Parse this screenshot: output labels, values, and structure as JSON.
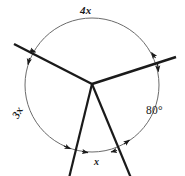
{
  "figure": {
    "type": "geometry-diagram",
    "stroke_colors": {
      "circle": "#6b6b6b",
      "rays": "#1a1a1a",
      "text": "#1a1a1a"
    },
    "background": "#ffffff",
    "circle": {
      "cx": 92,
      "cy": 85,
      "r": 67
    },
    "center_point": {
      "x": 92,
      "y": 84
    },
    "rays": [
      {
        "name": "ray-upper-left",
        "angle_deg": 153,
        "arc_x": 32.3,
        "arc_y": 54.6,
        "tip_x": 14,
        "tip_y": 44
      },
      {
        "name": "ray-right",
        "angle_deg": 20,
        "arc_x": 155.0,
        "arc_y": 62.1,
        "tip_x": 176,
        "tip_y": 57
      },
      {
        "name": "ray-lower-left",
        "angle_deg": 256,
        "arc_x": 75.8,
        "arc_y": 150.0,
        "tip_x": 69,
        "tip_y": 176
      },
      {
        "name": "ray-lower-right",
        "angle_deg": 292,
        "arc_x": 117.1,
        "arc_y": 147.1,
        "tip_x": 131,
        "tip_y": 176
      }
    ],
    "arcs": [
      {
        "name": "arc-4x",
        "label": "4x",
        "from_deg": 20,
        "to_deg": 153,
        "label_pos": "top"
      },
      {
        "name": "arc-3x",
        "label": "3x",
        "from_deg": 153,
        "to_deg": 256,
        "label_pos": "left"
      },
      {
        "name": "arc-x",
        "label": "x",
        "from_deg": 256,
        "to_deg": 292,
        "label_pos": "bottom"
      },
      {
        "name": "arc-80",
        "label": "80°",
        "from_deg": 292,
        "to_deg": 380,
        "label_pos": "right"
      }
    ],
    "labels": {
      "top_arc": "4x",
      "left_arc": "3x",
      "bottom_arc": "x",
      "right_arc": "80°"
    }
  }
}
